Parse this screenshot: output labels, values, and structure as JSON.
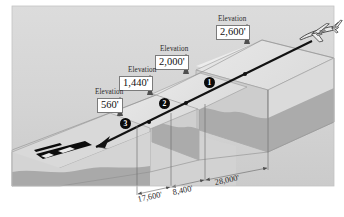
{
  "figure": {
    "type": "technical-illustration",
    "background_color": "#ffffff",
    "sky_color": "#d6d6d6"
  },
  "elevations": [
    {
      "id": "elev-2600",
      "word": "Elevation",
      "value": "2,600'",
      "numeric": 2600,
      "unit": "feet"
    },
    {
      "id": "elev-2000",
      "word": "Elevation",
      "value": "2,000'",
      "numeric": 2000,
      "unit": "feet"
    },
    {
      "id": "elev-1440",
      "word": "Elevation",
      "value": "1,440'",
      "numeric": 1440,
      "unit": "feet"
    },
    {
      "id": "elev-560",
      "word": "Elevation",
      "value": "560'",
      "numeric": 560,
      "unit": "feet"
    }
  ],
  "segments": [
    {
      "id": "segment-1",
      "label": "1"
    },
    {
      "id": "segment-2",
      "label": "2"
    },
    {
      "id": "segment-3",
      "label": "3"
    }
  ],
  "dimensions": [
    {
      "id": "dim-17600",
      "value": "17,600'",
      "numeric": 17600,
      "unit": "feet"
    },
    {
      "id": "dim-8400",
      "value": "8,400'",
      "numeric": 8400,
      "unit": "feet"
    },
    {
      "id": "dim-28000",
      "value": "28,000'",
      "numeric": 28000,
      "unit": "feet"
    }
  ],
  "icons": {
    "airplane": "airplane-icon",
    "runway": "runway-icon",
    "descent_arrow": "descent-arrow-icon"
  },
  "colors": {
    "sky": "#d6d6d6",
    "terrain_top": "#e3e3e3",
    "terrain_face": "#cfcfcf",
    "terrain_rock": "#a8a8a8",
    "flight_path": "#111111",
    "runway": "#0b0b0b",
    "leader_line": "#5a5a5a"
  }
}
